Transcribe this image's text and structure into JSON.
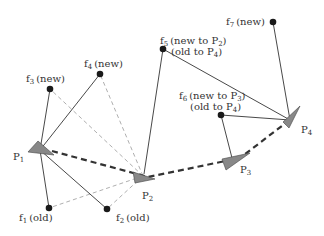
{
  "diagram": {
    "colors": {
      "solid_edge": "#333333",
      "dashed_feature_edge": "#999999",
      "trajectory": "#333333",
      "pose_fill": "#888888",
      "feature_fill": "#1a1a1a"
    },
    "poses": [
      {
        "id": "P1",
        "label": "P",
        "sub": "1"
      },
      {
        "id": "P2",
        "label": "P",
        "sub": "2"
      },
      {
        "id": "P3",
        "label": "P",
        "sub": "3"
      },
      {
        "id": "P4",
        "label": "P",
        "sub": "4"
      }
    ],
    "features": [
      {
        "id": "f1",
        "label": "f",
        "sub": "1",
        "note": "(old)"
      },
      {
        "id": "f2",
        "label": "f",
        "sub": "2",
        "note": "(old)"
      },
      {
        "id": "f3",
        "label": "f",
        "sub": "3",
        "note": "(new)"
      },
      {
        "id": "f4",
        "label": "f",
        "sub": "4",
        "note": "(new)"
      },
      {
        "id": "f5",
        "label": "f",
        "sub": "5",
        "note": "(new to P",
        "note_sub": "2",
        "note_end": ")",
        "note2": "(old to P",
        "note2_sub": "4",
        "note2_end": ")"
      },
      {
        "id": "f6",
        "label": "f",
        "sub": "6",
        "note": "(new to P",
        "note_sub": "3",
        "note_end": ")",
        "note2": "(old to P",
        "note2_sub": "4",
        "note2_end": ")"
      },
      {
        "id": "f7",
        "label": "f",
        "sub": "7",
        "note": "(new)"
      }
    ],
    "edges_solid": [
      [
        "P1",
        "f3"
      ],
      [
        "P1",
        "f4"
      ],
      [
        "P1",
        "f1"
      ],
      [
        "P1",
        "f2"
      ],
      [
        "P2",
        "f5"
      ],
      [
        "P4",
        "f5"
      ],
      [
        "P4",
        "f7"
      ],
      [
        "P4",
        "f6"
      ],
      [
        "P3",
        "f6"
      ]
    ],
    "edges_dashed_light": [
      [
        "P2",
        "f3"
      ],
      [
        "P2",
        "f4"
      ],
      [
        "P2",
        "f1"
      ],
      [
        "P2",
        "f2"
      ]
    ],
    "trajectory": [
      "P1",
      "P2",
      "P3",
      "P4"
    ]
  }
}
